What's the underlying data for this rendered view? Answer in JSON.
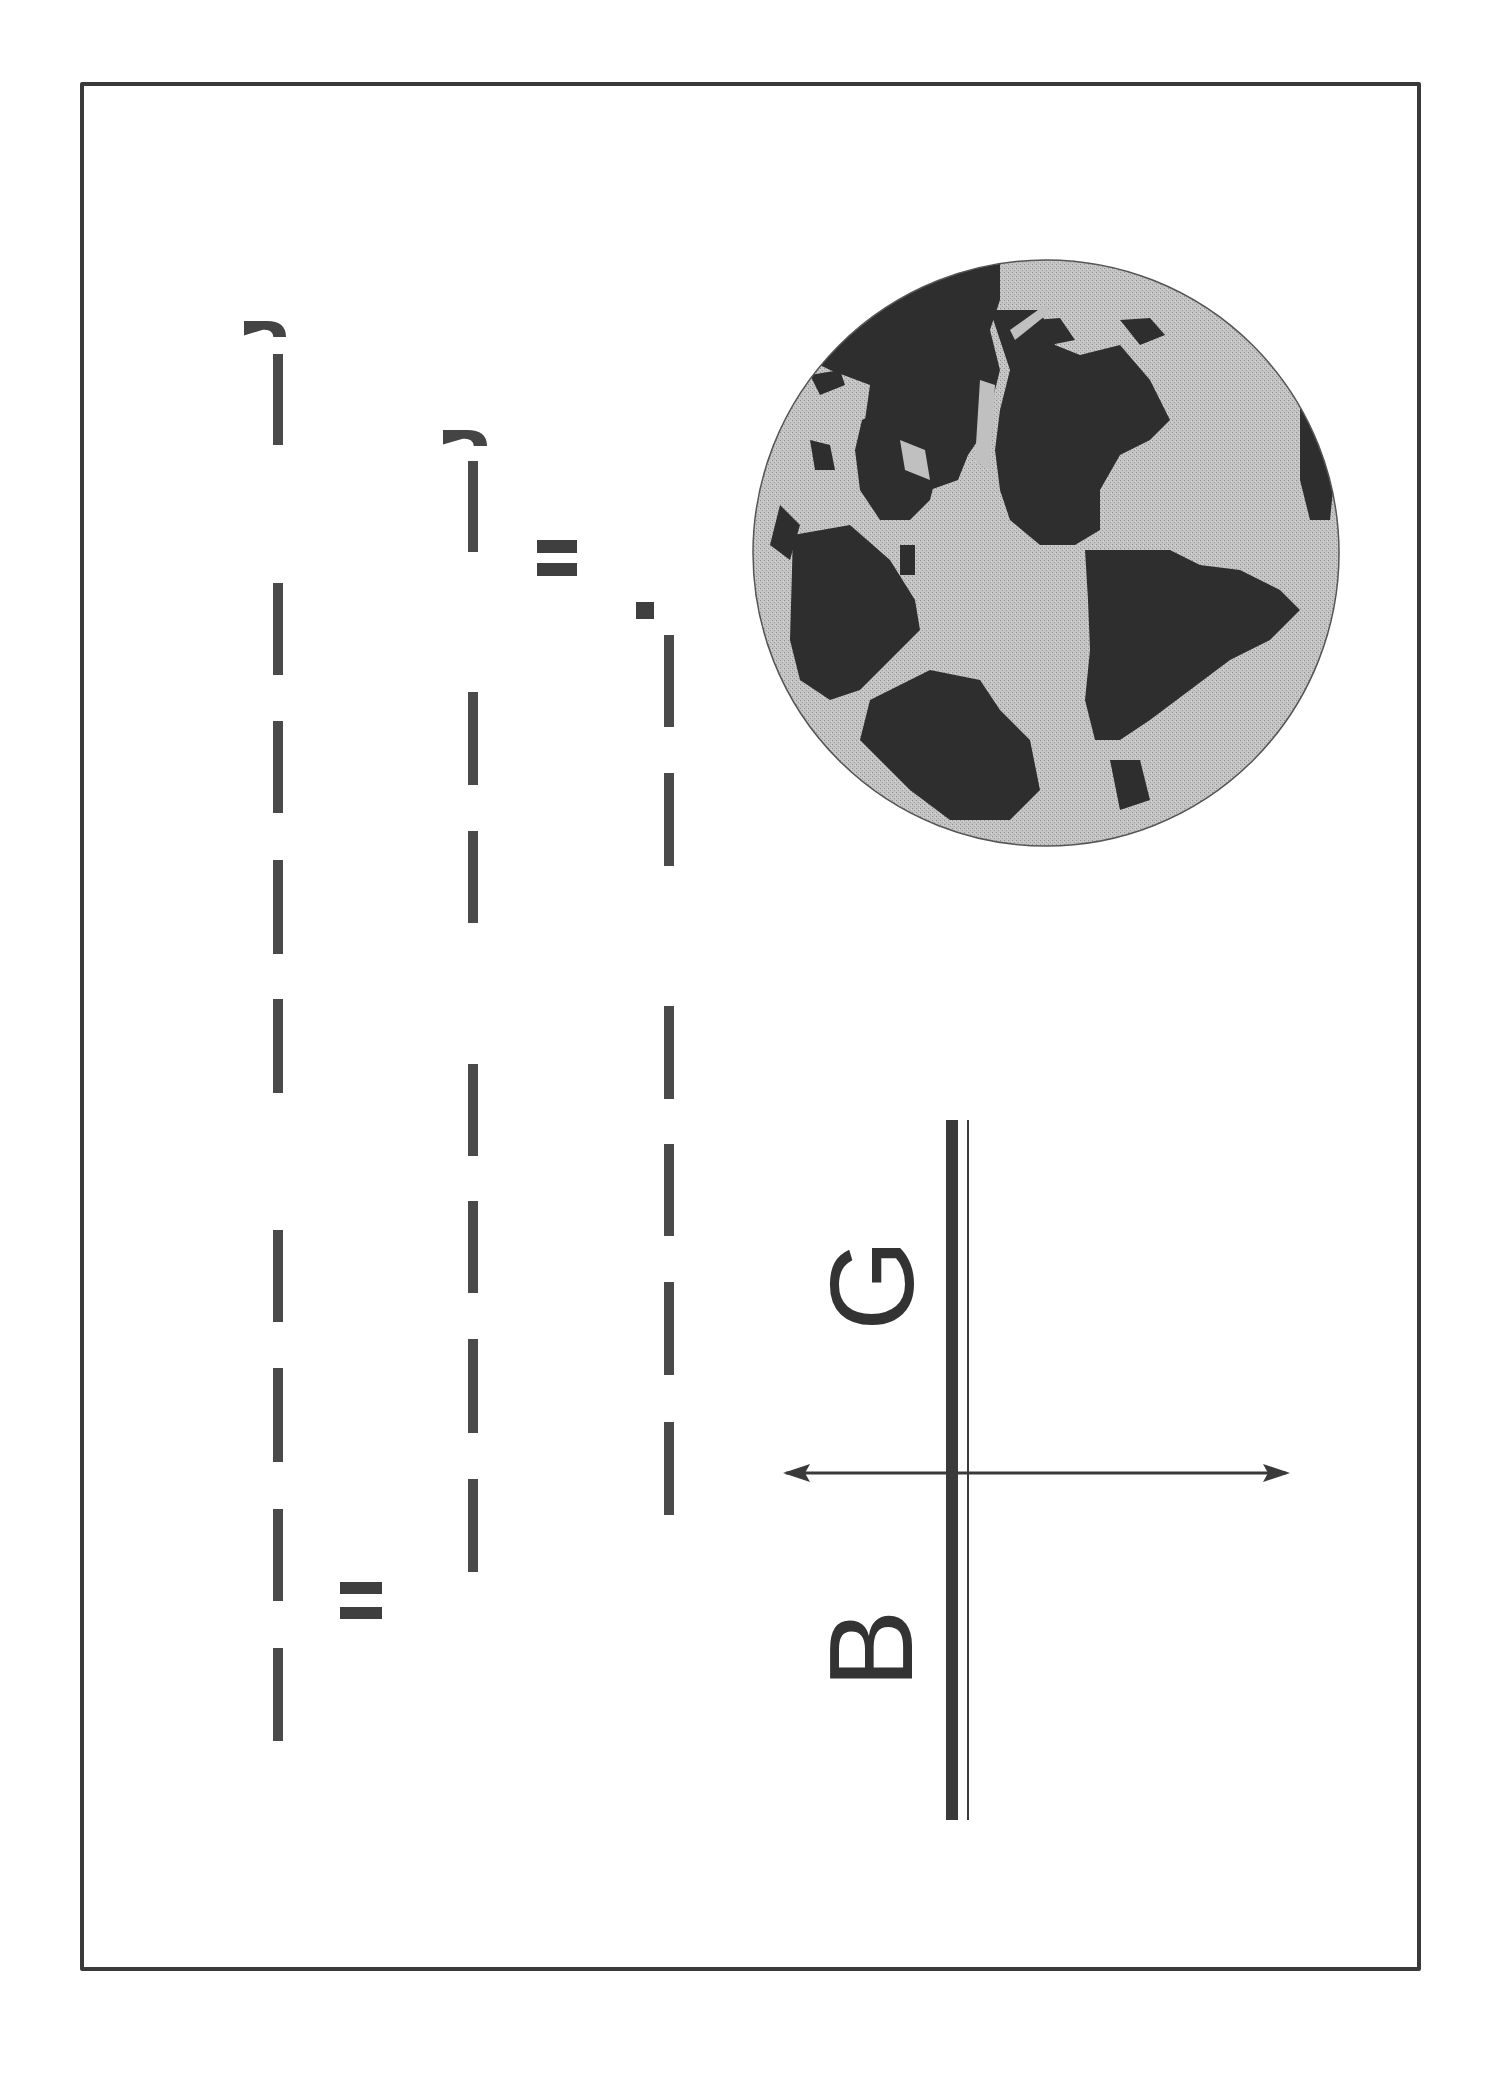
{
  "page": {
    "orientation": "rotated 90 degrees counter-clockwise (scanned figure)",
    "border_color": "#3a3a3a",
    "ink_color": "#4a4a4a"
  },
  "text_columns": [
    {
      "id": "line-1",
      "x": 273,
      "hook": {
        "x": 244,
        "y": 321,
        "w": 42,
        "h": 16
      },
      "dashes": [
        [
          354,
          445
        ],
        [
          583,
          675
        ],
        [
          721,
          813
        ],
        [
          860,
          954
        ],
        [
          999,
          1093
        ],
        [
          1230,
          1322
        ],
        [
          1368,
          1462
        ],
        [
          1509,
          1601
        ],
        [
          1648,
          1741
        ]
      ]
    },
    {
      "id": "line-2",
      "x": 468,
      "hook": {
        "x": 443,
        "y": 430,
        "w": 44,
        "h": 16
      },
      "dashes": [
        [
          461,
          552
        ],
        [
          692,
          785
        ],
        [
          831,
          923
        ],
        [
          1064,
          1156
        ],
        [
          1201,
          1293
        ],
        [
          1339,
          1433
        ],
        [
          1479,
          1572
        ]
      ]
    },
    {
      "id": "line-3",
      "x": 664,
      "dashes": [
        [
          635,
          727
        ],
        [
          773,
          866
        ],
        [
          1006,
          1099
        ],
        [
          1144,
          1236
        ],
        [
          1282,
          1375
        ],
        [
          1422,
          1515
        ]
      ]
    }
  ],
  "equals_marks": [
    {
      "x": 537,
      "y1": 540,
      "y2": 563,
      "w": 40,
      "h": 13
    },
    {
      "x": 340,
      "y1": 1582,
      "y2": 1607,
      "w": 42,
      "h": 12
    }
  ],
  "dot_mark": {
    "x": 636,
    "y": 602,
    "w": 18,
    "h": 17
  },
  "globe": {
    "cx": 1046,
    "cy": 553,
    "r": 293,
    "ocean_color": "#b9b9b9",
    "land_color": "#2e2e2e",
    "caption": "World map (rotated)"
  },
  "axis_diagram": {
    "labels": {
      "upper": "G",
      "lower": "B"
    },
    "thick_line": {
      "x": 946,
      "y1": 1120,
      "y2": 1820,
      "w": 12
    },
    "thin_line": {
      "x": 967,
      "y1": 1120,
      "y2": 1820,
      "w": 2
    },
    "arrow": {
      "y": 1473,
      "x1": 783,
      "x2": 1290
    }
  }
}
